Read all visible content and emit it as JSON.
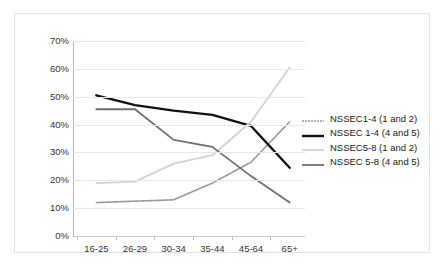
{
  "chart_data": {
    "type": "line",
    "title": "",
    "subtitle": "",
    "xlabel": "",
    "ylabel": "",
    "categories": [
      "16-25",
      "26-29",
      "30-34",
      "35-44",
      "45-64",
      "65+"
    ],
    "ylim": [
      0,
      70
    ],
    "y_ticks": [
      0,
      10,
      20,
      30,
      40,
      50,
      60,
      70
    ],
    "y_tick_labels": [
      "0%",
      "10%",
      "20%",
      "30%",
      "40%",
      "50%",
      "60%",
      "70%"
    ],
    "grid": true,
    "legend_position": "right",
    "series": [
      {
        "name": "NSSEC1-4 (1 and 2)",
        "color": "#9a9a9a",
        "style": "dotted",
        "width": 1.6,
        "values": [
          12,
          12.5,
          13,
          19,
          26.5,
          41
        ]
      },
      {
        "name": "NSSEC 1-4 (4 and 5)",
        "color": "#111111",
        "style": "solid",
        "width": 2.4,
        "values": [
          50.5,
          47,
          45,
          43.5,
          39.5,
          24.5
        ]
      },
      {
        "name": "NSSEC5-8 (1 and 2)",
        "color": "#d2d2d2",
        "style": "solid",
        "width": 1.8,
        "values": [
          19,
          19.5,
          26,
          29,
          41,
          60.5
        ]
      },
      {
        "name": "NSSEC 5-8 (4 and 5)",
        "color": "#6e6e6e",
        "style": "solid",
        "width": 1.8,
        "values": [
          45.5,
          45.5,
          34.5,
          32,
          21.5,
          12
        ]
      }
    ]
  },
  "legend": {
    "items": [
      {
        "label": "NSSEC1-4 (1 and 2)"
      },
      {
        "label": "NSSEC 1-4 (4 and 5)"
      },
      {
        "label": "NSSEC5-8 (1 and 2)"
      },
      {
        "label": "NSSEC 5-8 (4 and 5)"
      }
    ]
  }
}
